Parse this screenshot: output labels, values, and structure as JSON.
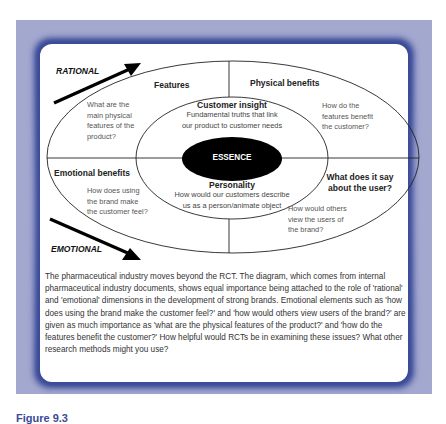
{
  "diagram": {
    "axis_labels": {
      "rational": "RATIONAL",
      "emotional": "EMOTIONAL"
    },
    "center": "ESSENCE",
    "inner_ring": {
      "customer_insight": {
        "title": "Customer insight",
        "lines": [
          "Fundamental truths that link",
          "our product to customer needs"
        ]
      },
      "personality": {
        "title": "Personality",
        "lines": [
          "How would our customers describe",
          "us as a person/animate object"
        ]
      }
    },
    "outer_quadrants": {
      "features": {
        "title": "Features",
        "lines": [
          "What are the",
          "main physical",
          "features of the",
          "product?"
        ]
      },
      "physical_benefits": {
        "title": "Physical benefits",
        "lines": [
          "How do the",
          "features benefit",
          "the customer?"
        ]
      },
      "emotional_benefits": {
        "title": "Emotional benefits",
        "lines": [
          "How does using",
          "the brand make",
          "the customer feel?"
        ]
      },
      "user": {
        "title_lines": [
          "What does it say",
          "about the user?"
        ],
        "lines": [
          "How would others",
          "view the users of",
          "the brand?"
        ]
      }
    },
    "colors": {
      "frame_light": "#a3a8cf",
      "frame_dark": "#3a4a96",
      "essence_fill": "#000000",
      "line": "#222222"
    }
  },
  "caption": "The pharmaceutical industry moves beyond the RCT. The diagram, which comes from internal pharmaceutical industry documents, shows equal importance being attached to the role of 'rational' and 'emotional' dimensions in the development of strong brands. Emotional elements such as 'how does using the brand make the customer feel?' and 'how would others view users of the brand?' are given as much importance as 'what are the physical features of the product?' and 'how do the features benefit the customer?' How helpful would RCTs be in examining these issues? What other research methods might you use?",
  "figure_label": "Figure 9.3"
}
